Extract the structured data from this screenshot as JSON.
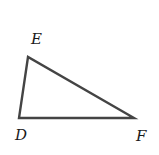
{
  "diagram": {
    "type": "triangle",
    "stroke_color": "#444444",
    "fill_color": "#ffffff",
    "vertices": [
      {
        "name": "E",
        "x": 28,
        "y": 57,
        "label_x": 31,
        "label_y": 44
      },
      {
        "name": "D",
        "x": 19,
        "y": 118,
        "label_x": 15,
        "label_y": 140
      },
      {
        "name": "F",
        "x": 134,
        "y": 118,
        "label_x": 136,
        "label_y": 141
      }
    ],
    "labels": {
      "E": "E",
      "D": "D",
      "F": "F"
    }
  }
}
